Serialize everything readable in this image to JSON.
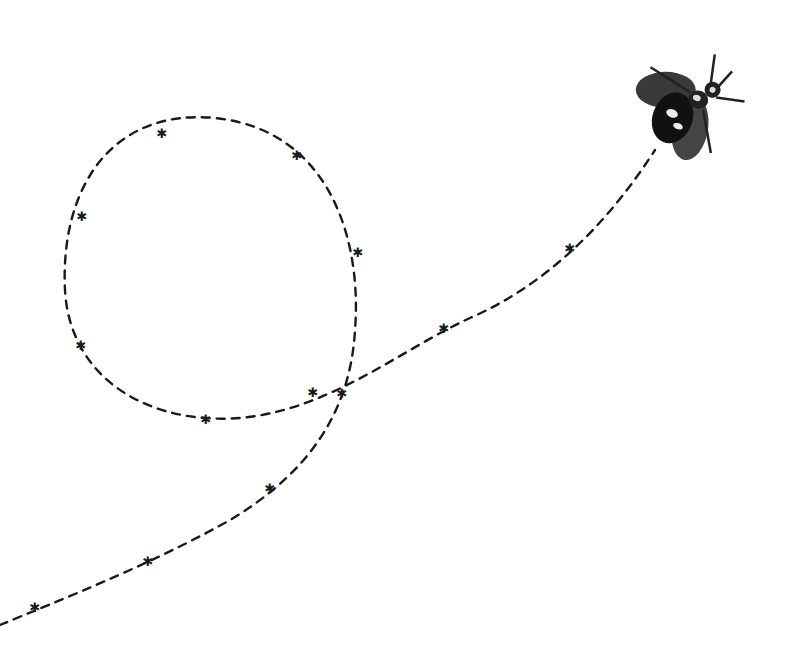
{
  "illustration": {
    "subject": "fly",
    "description": "Engraved-style illustration of a fly at the end of a dashed looping flight path with asterisk markers",
    "path_color": "#1a1a1a",
    "background": "#ffffff",
    "marker_glyph": "✱",
    "markers": [
      {
        "x": 35,
        "y": 607
      },
      {
        "x": 148,
        "y": 561
      },
      {
        "x": 270,
        "y": 488
      },
      {
        "x": 342,
        "y": 393
      },
      {
        "x": 358,
        "y": 252
      },
      {
        "x": 297,
        "y": 155
      },
      {
        "x": 162,
        "y": 133
      },
      {
        "x": 82,
        "y": 216
      },
      {
        "x": 81,
        "y": 345
      },
      {
        "x": 206,
        "y": 419
      },
      {
        "x": 313,
        "y": 392
      },
      {
        "x": 444,
        "y": 328
      },
      {
        "x": 570,
        "y": 248
      }
    ]
  }
}
